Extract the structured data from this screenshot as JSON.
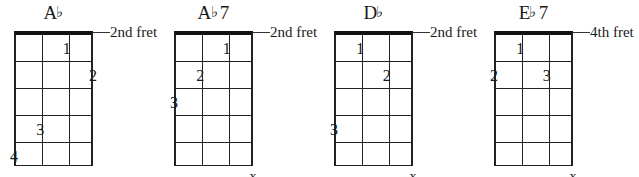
{
  "sheet": {
    "title": "Chord diagrams",
    "strings": 4,
    "frets": 5
  },
  "chart_data": {
    "type": "table",
    "xlabel": "string",
    "ylabel": "fret",
    "categories": [
      "A♭",
      "A♭7",
      "D♭",
      "E♭7"
    ],
    "diagrams": [
      {
        "name_root": "A",
        "name_accidental": "♭",
        "name_suffix": "",
        "name_full": "A♭",
        "fret_label": "2nd fret",
        "fingers": [
          {
            "label": "1",
            "string": 3,
            "fret": 1
          },
          {
            "label": "2",
            "string": 4,
            "fret": 2
          },
          {
            "label": "3",
            "string": 2,
            "fret": 4
          },
          {
            "label": "4",
            "string": 1,
            "fret": 5
          }
        ],
        "mute": null
      },
      {
        "name_root": "A",
        "name_accidental": "♭",
        "name_suffix": "7",
        "name_full": "A♭7",
        "fret_label": "2nd fret",
        "fingers": [
          {
            "label": "1",
            "string": 3,
            "fret": 1
          },
          {
            "label": "2",
            "string": 2,
            "fret": 2
          },
          {
            "label": "3",
            "string": 1,
            "fret": 3
          }
        ],
        "mute": {
          "label": "x",
          "string": 4
        }
      },
      {
        "name_root": "D",
        "name_accidental": "♭",
        "name_suffix": "",
        "name_full": "D♭",
        "fret_label": "2nd fret",
        "fingers": [
          {
            "label": "1",
            "string": 2,
            "fret": 1
          },
          {
            "label": "2",
            "string": 3,
            "fret": 2
          },
          {
            "label": "3",
            "string": 1,
            "fret": 4
          }
        ],
        "mute": {
          "label": "x",
          "string": 4
        }
      },
      {
        "name_root": "E",
        "name_accidental": "♭",
        "name_suffix": "7",
        "name_full": "E♭7",
        "fret_label": "4th fret",
        "fingers": [
          {
            "label": "1",
            "string": 2,
            "fret": 1
          },
          {
            "label": "2",
            "string": 1,
            "fret": 2
          },
          {
            "label": "3",
            "string": 3,
            "fret": 2
          }
        ],
        "mute": {
          "label": "x",
          "string": 4
        }
      }
    ]
  }
}
